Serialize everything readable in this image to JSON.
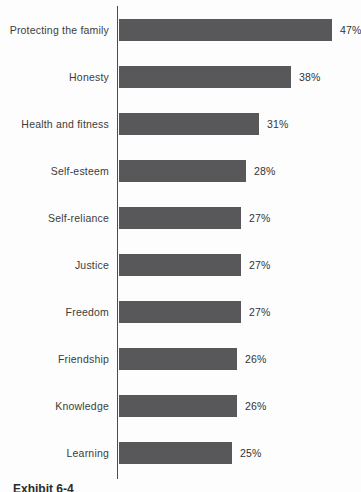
{
  "page": {
    "exhibit_caption": "Exhibit 6-4"
  },
  "chart_data": {
    "type": "bar",
    "orientation": "horizontal",
    "title": "",
    "xlabel": "",
    "ylabel": "",
    "categories": [
      "Protecting the family",
      "Honesty",
      "Health and fitness",
      "Self-esteem",
      "Self-reliance",
      "Justice",
      "Freedom",
      "Friendship",
      "Knowledge",
      "Learning"
    ],
    "values": [
      47,
      38,
      31,
      28,
      27,
      27,
      27,
      26,
      26,
      25
    ],
    "value_labels": [
      "47%",
      "38%",
      "31%",
      "28%",
      "27%",
      "27%",
      "27%",
      "26%",
      "26%",
      "25%"
    ],
    "xlim": [
      0,
      50
    ],
    "grid": false,
    "legend": "none",
    "bar_color": "#58585a",
    "axis_color": "#4d4d4d",
    "label_color": "#3c3c3c"
  }
}
